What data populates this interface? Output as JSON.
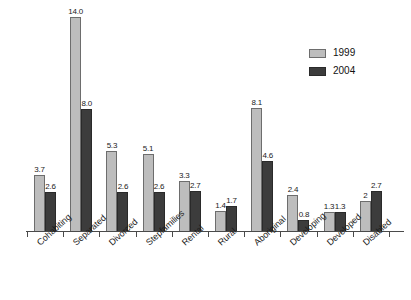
{
  "chart_data": {
    "type": "bar",
    "title": "",
    "subtitle": "",
    "xlabel": "",
    "ylabel": "",
    "ylim": [
      0,
      14.6
    ],
    "grid": false,
    "legend_position": "top-right",
    "categories": [
      "Cohabiting",
      "Separated",
      "Divorced",
      "Stepfamilies",
      "Rental",
      "Rural",
      "Aboriginal",
      "Developing",
      "Developed",
      "Disabled"
    ],
    "series": [
      {
        "name": "1999",
        "color": "#bdbdbd",
        "values": [
          3.7,
          14.0,
          5.3,
          5.1,
          3.3,
          1.4,
          8.1,
          2.4,
          1.3,
          2
        ],
        "labels": [
          "3.7",
          "14.0",
          "5.3",
          "5.1",
          "3.3",
          "1.4",
          "8.1",
          "2.4",
          "1.3",
          "2"
        ]
      },
      {
        "name": "2004",
        "color": "#3c3c3c",
        "values": [
          2.6,
          8.0,
          2.6,
          2.6,
          2.7,
          1.7,
          4.6,
          0.8,
          1.3,
          2.7
        ],
        "labels": [
          "2.6",
          "8.0",
          "2.6",
          "2.6",
          "2.7",
          "1.7",
          "4.6",
          "0.8",
          "1.3",
          "2.7"
        ]
      }
    ]
  },
  "legend": {
    "items": [
      {
        "label": "1999",
        "swatch_class": "s1999"
      },
      {
        "label": "2004",
        "swatch_class": "s2004"
      }
    ]
  }
}
